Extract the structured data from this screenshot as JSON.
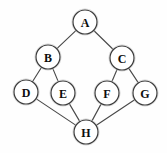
{
  "figure": {
    "kind": "node-link-graph",
    "title": "",
    "background_color": "#fefefe",
    "node_fill_color": "#ffffff",
    "node_stroke_color": "#3a3a3a",
    "edge_color": "#4a4a4a",
    "label_color": "#0d0d0d",
    "node_radius": 12
  },
  "nodes": [
    {
      "id": "A",
      "label": "A",
      "x": 85,
      "y": 22
    },
    {
      "id": "B",
      "label": "B",
      "x": 48,
      "y": 57
    },
    {
      "id": "C",
      "label": "C",
      "x": 122,
      "y": 58
    },
    {
      "id": "D",
      "label": "D",
      "x": 26,
      "y": 92
    },
    {
      "id": "E",
      "label": "E",
      "x": 63,
      "y": 93
    },
    {
      "id": "F",
      "label": "F",
      "x": 107,
      "y": 93
    },
    {
      "id": "G",
      "label": "G",
      "x": 145,
      "y": 93
    },
    {
      "id": "H",
      "label": "H",
      "x": 86,
      "y": 132
    }
  ],
  "edges": [
    {
      "from": "A",
      "to": "B"
    },
    {
      "from": "A",
      "to": "C"
    },
    {
      "from": "B",
      "to": "D"
    },
    {
      "from": "B",
      "to": "E"
    },
    {
      "from": "C",
      "to": "F"
    },
    {
      "from": "C",
      "to": "G"
    },
    {
      "from": "D",
      "to": "H"
    },
    {
      "from": "E",
      "to": "H"
    },
    {
      "from": "F",
      "to": "H"
    },
    {
      "from": "G",
      "to": "H"
    }
  ]
}
